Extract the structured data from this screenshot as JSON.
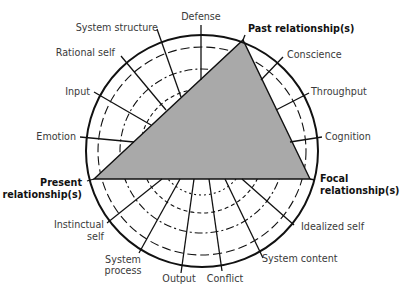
{
  "diagram": {
    "colors": {
      "triangle_fill": "#a9a9a9",
      "stroke": "#111111",
      "label": "#3a3a3a",
      "bold_label": "#111111",
      "background": "#ffffff"
    },
    "triangle_vertices": {
      "top": "Past relationship(s)",
      "left": "Present relationship(s)",
      "right": "Focal relationship(s)"
    },
    "labels": {
      "defense": "Defense",
      "system_structure": "System structure",
      "rational_self": "Rational self",
      "input": "Input",
      "emotion": "Emotion",
      "past_relationships": "Past relationship(s)",
      "conscience": "Conscience",
      "throughput": "Throughput",
      "cognition": "Cognition",
      "present_line1": "Present",
      "present_line2": "relationship(s)",
      "focal_line1": "Focal",
      "focal_line2": "relationship(s)",
      "instinctual_line1": "Instinctual",
      "instinctual_line2": "self",
      "system_process_line1": "System",
      "system_process_line2": "process",
      "output": "Output",
      "conflict": "Conflict",
      "system_content": "System content",
      "idealized_self": "Idealized self"
    },
    "rings": [
      "solid",
      "long-dash",
      "dash-dot",
      "short-dash",
      "dotted"
    ]
  }
}
